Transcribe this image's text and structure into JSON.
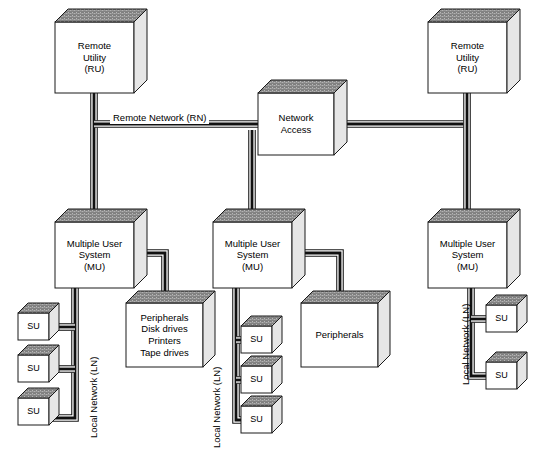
{
  "diagram": {
    "colors": {
      "line": "#1a1a1a",
      "box_face": "#ffffff",
      "box_top": "#8d8d8d",
      "box_side": "#e6e6e6",
      "cable": "#111111",
      "text": "#000000"
    },
    "nodes": [
      {
        "id": "ru-left",
        "type": "box3d",
        "label": "Remote\nUtility\n(RU)",
        "x": 55,
        "y": 22,
        "w": 79,
        "h": 71,
        "depth": 13,
        "font": 9.5
      },
      {
        "id": "ru-right",
        "type": "box3d",
        "label": "Remote\nUtility\n(RU)",
        "x": 428,
        "y": 22,
        "w": 79,
        "h": 71,
        "depth": 13,
        "font": 9.5
      },
      {
        "id": "network-access",
        "type": "box3d",
        "label": "Network\nAccess",
        "x": 258,
        "y": 93,
        "w": 76,
        "h": 62,
        "depth": 13,
        "font": 9.5
      },
      {
        "id": "mu-left",
        "type": "box3d",
        "label": "Multiple User\nSystem\n(MU)",
        "x": 55,
        "y": 222,
        "w": 79,
        "h": 66,
        "depth": 13,
        "font": 9.5
      },
      {
        "id": "mu-middle",
        "type": "box3d",
        "label": "Multiple User\nSystem\n(MU)",
        "x": 213,
        "y": 222,
        "w": 79,
        "h": 66,
        "depth": 13,
        "font": 9.5
      },
      {
        "id": "mu-right",
        "type": "box3d",
        "label": "Multiple User\nSystem\n(MU)",
        "x": 428,
        "y": 222,
        "w": 79,
        "h": 66,
        "depth": 13,
        "font": 9.5
      },
      {
        "id": "peripherals-left",
        "type": "box3d",
        "label": "Peripherals\nDisk drives\nPrinters\nTape drives",
        "x": 126,
        "y": 303,
        "w": 77,
        "h": 64,
        "depth": 12,
        "font": 9.5
      },
      {
        "id": "peripherals-middle",
        "type": "box3d",
        "label": "Peripherals",
        "x": 301,
        "y": 303,
        "w": 77,
        "h": 64,
        "depth": 12,
        "font": 9.5
      },
      {
        "id": "su-left-1",
        "type": "box3d",
        "label": "SU",
        "x": 18,
        "y": 313,
        "w": 31,
        "h": 27,
        "depth": 10,
        "font": 9
      },
      {
        "id": "su-left-2",
        "type": "box3d",
        "label": "SU",
        "x": 18,
        "y": 355,
        "w": 31,
        "h": 27,
        "depth": 10,
        "font": 9
      },
      {
        "id": "su-left-3",
        "type": "box3d",
        "label": "SU",
        "x": 18,
        "y": 398,
        "w": 31,
        "h": 27,
        "depth": 10,
        "font": 9
      },
      {
        "id": "su-mid-1",
        "type": "box3d",
        "label": "SU",
        "x": 241,
        "y": 326,
        "w": 31,
        "h": 27,
        "depth": 10,
        "font": 9
      },
      {
        "id": "su-mid-2",
        "type": "box3d",
        "label": "SU",
        "x": 241,
        "y": 366,
        "w": 31,
        "h": 27,
        "depth": 10,
        "font": 9
      },
      {
        "id": "su-mid-3",
        "type": "box3d",
        "label": "SU",
        "x": 241,
        "y": 406,
        "w": 31,
        "h": 27,
        "depth": 10,
        "font": 9
      },
      {
        "id": "su-right-1",
        "type": "box3d",
        "label": "SU",
        "x": 486,
        "y": 305,
        "w": 31,
        "h": 27,
        "depth": 10,
        "font": 9
      },
      {
        "id": "su-right-2",
        "type": "box3d",
        "label": "SU",
        "x": 486,
        "y": 362,
        "w": 31,
        "h": 27,
        "depth": 10,
        "font": 9
      }
    ],
    "labels": [
      {
        "id": "remote-network-label",
        "text": "Remote Network (RN)",
        "x": 110,
        "y": 112,
        "font": 9.5,
        "rotated": false
      },
      {
        "id": "ln-label-left",
        "text": "Local Network (LN)",
        "x": 88,
        "y": 438,
        "font": 9.5,
        "rotated": true
      },
      {
        "id": "ln-label-middle",
        "text": "Local Network (LN)",
        "x": 211,
        "y": 448,
        "font": 9.5,
        "rotated": true
      },
      {
        "id": "ln-label-right",
        "text": "Local Network (LN)",
        "x": 460,
        "y": 385,
        "font": 9.5,
        "rotated": true
      }
    ],
    "cables": {
      "description": "3D tube connectors: white channel with dark fill line",
      "segments": [
        {
          "id": "ru-left-down",
          "points": "94,93 94,222"
        },
        {
          "id": "rn-trunk",
          "points": "94,124 258,124"
        },
        {
          "id": "rn-right",
          "points": "334,124 467,124"
        },
        {
          "id": "ru-right-down",
          "points": "467,93 467,222"
        },
        {
          "id": "na-to-mu-middle",
          "points": "252,130 252,222"
        },
        {
          "id": "mu-left-to-periph",
          "points": "134,253 165,253 165,303"
        },
        {
          "id": "mu-mid-to-periph",
          "points": "292,253 340,253 340,303"
        },
        {
          "id": "mu-left-ln",
          "points": "75,288 75,418 49,418"
        },
        {
          "id": "mu-left-ln-tap1",
          "points": "75,327 49,327"
        },
        {
          "id": "mu-left-ln-tap2",
          "points": "75,369 49,369"
        },
        {
          "id": "mu-mid-ln",
          "points": "236,288 236,420 241,420"
        },
        {
          "id": "mu-mid-ln-tap1",
          "points": "236,340 241,340"
        },
        {
          "id": "mu-mid-ln-tap2",
          "points": "236,380 241,380"
        },
        {
          "id": "mu-right-ln",
          "points": "471,288 471,376 486,376"
        },
        {
          "id": "mu-right-ln-tap1",
          "points": "471,319 486,319"
        }
      ]
    }
  }
}
